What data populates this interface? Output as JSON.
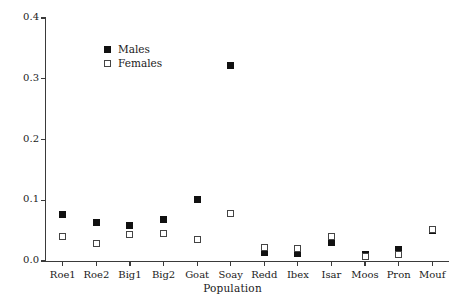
{
  "chart_data": {
    "type": "scatter",
    "title": "",
    "xlabel": "Population",
    "ylabel": "Initial mortality rate",
    "categories": [
      "Roe1",
      "Roe2",
      "Big1",
      "Big2",
      "Goat",
      "Soay",
      "Redd",
      "Ibex",
      "Isar",
      "Moos",
      "Pron",
      "Mouf"
    ],
    "yticks": [
      "0.0",
      "0.1",
      "0.2",
      "0.3",
      "0.4"
    ],
    "ytick_values": [
      0.0,
      0.1,
      0.2,
      0.3,
      0.4
    ],
    "ylim": [
      0.0,
      0.4
    ],
    "grid": false,
    "legend_position": "top-left",
    "series": [
      {
        "name": "Males",
        "marker": "filled-square",
        "color": "#111111",
        "values": [
          0.076,
          0.064,
          0.058,
          0.068,
          0.101,
          0.321,
          0.014,
          0.013,
          0.03,
          0.01,
          0.019,
          0.05
        ]
      },
      {
        "name": "Females",
        "marker": "open-square",
        "color": "#ffffff",
        "values": [
          0.04,
          0.028,
          0.044,
          0.045,
          0.035,
          0.078,
          0.022,
          0.021,
          0.04,
          0.008,
          0.011,
          0.052
        ]
      }
    ]
  },
  "legend": {
    "entries": [
      {
        "label": "Males",
        "key": "filled-square"
      },
      {
        "label": "Females",
        "key": "open-square"
      }
    ]
  }
}
